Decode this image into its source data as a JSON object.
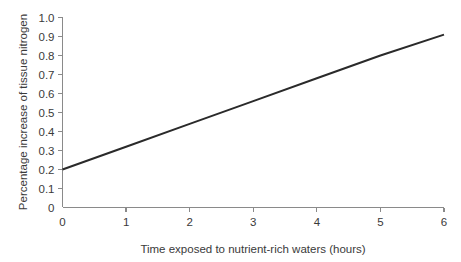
{
  "chart_data": {
    "type": "line",
    "title": "",
    "subtitle": "",
    "xlabel": "Time exposed to nutrient-rich waters (hours)",
    "ylabel": "Percentage increase of tissue nitrogen",
    "xlim": [
      0,
      6
    ],
    "ylim": [
      0,
      1.0
    ],
    "grid": false,
    "legend": false,
    "legend_position": "none",
    "x_ticks": [
      "0",
      "1",
      "2",
      "3",
      "4",
      "5",
      "6"
    ],
    "x_tick_values": [
      0,
      1,
      2,
      3,
      4,
      5,
      6
    ],
    "y_ticks": [
      "0",
      "0.1",
      "0.2",
      "0.3",
      "0.4",
      "0.5",
      "0.6",
      "0.7",
      "0.8",
      "0.9",
      "1.0"
    ],
    "y_tick_values": [
      0,
      0.1,
      0.2,
      0.3,
      0.4,
      0.5,
      0.6,
      0.7,
      0.8,
      0.9,
      1.0
    ],
    "series": [
      {
        "name": "tissue nitrogen increase",
        "color": "#2a2a2a",
        "x": [
          0,
          1,
          2,
          3,
          4,
          5,
          6
        ],
        "values": [
          0.2,
          0.32,
          0.44,
          0.56,
          0.68,
          0.8,
          0.91
        ]
      }
    ],
    "annotations": []
  },
  "colors": {
    "background": "#ffffff",
    "axis": "#8a8a8a",
    "text": "#3a3a3a",
    "series": "#2a2a2a"
  }
}
